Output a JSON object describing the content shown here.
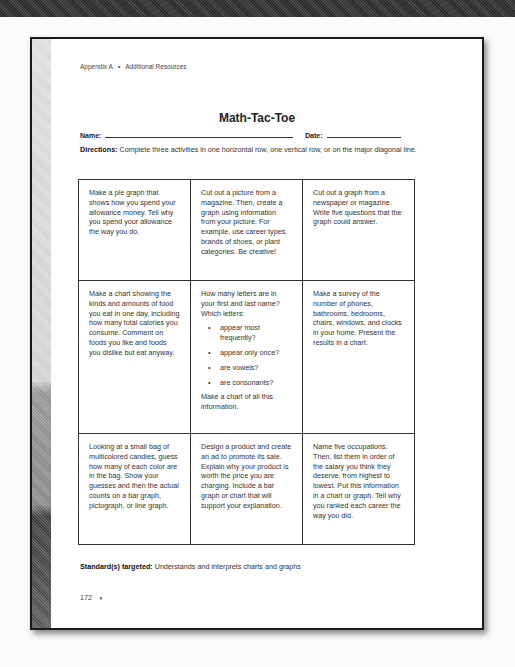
{
  "running_head": {
    "section": "Appendix A",
    "separator": "•",
    "title": "Additional Resources"
  },
  "title": "Math-Tac-Toe",
  "fields": {
    "name_label": "Name:",
    "date_label": "Date:"
  },
  "directions": {
    "label": "Directions:",
    "text": " Complete three activities in one horizontal row, one vertical row, or on the major diagonal line."
  },
  "grid": {
    "rows": [
      {
        "cells": [
          {
            "text": "Make a pie graph that shows how you spend your allowance money. Tell why you spend your allowance the way you do."
          },
          {
            "text": "Cut out a picture from a magazine. Then, create a graph using information from your picture. For example, use career types, brands of shoes, or plant categories. Be creative!"
          },
          {
            "text": "Cut out a graph from a newspaper or magazine. Write five questions that the graph could answer."
          }
        ]
      },
      {
        "cells": [
          {
            "text": "Make a chart showing the kinds and amounts of food you eat in one day, including how many total calories you consume. Comment on foods you like and foods you dislike but eat anyway."
          },
          {
            "intro": "How many letters are in your first and last name? Which letters:",
            "bullets": [
              "appear most frequently?",
              "appear only once?",
              "are vowels?",
              "are consonants?"
            ],
            "outro": "Make a chart of all this information."
          },
          {
            "text": "Make a survey of the number of phones, bathrooms, bedrooms, chairs, windows, and clocks in your home. Present the results in a chart."
          }
        ]
      },
      {
        "cells": [
          {
            "text": "Looking at a small bag of multicolored candies, guess how many of each color are in the bag. Show your guesses and then the actual counts on a bar graph, pictograph, or line graph."
          },
          {
            "text": "Design a product and create an ad to promote its sale. Explain why your product is worth the price you are charging. Include a bar graph or chart that will support your explanation."
          },
          {
            "text": "Name five occupations. Then, list them in order of the salary you think they deserve, from highest to lowest. Put this information in a chart or graph. Tell why you ranked each career the way you did."
          }
        ]
      }
    ]
  },
  "standard": {
    "label": "Standard(s) targeted:",
    "text": " Understands and interprets charts and graphs"
  },
  "footer": {
    "page_number": "172",
    "mark": "●"
  }
}
